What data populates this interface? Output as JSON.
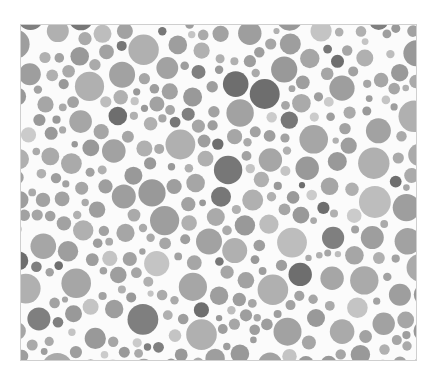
{
  "image": {
    "description": "Grayscale Ishihara-style color vision test plate of packed circles",
    "plate": {
      "x": 20,
      "y": 24,
      "width": 397,
      "height": 337
    },
    "background": "#fbfbfb",
    "palette": {
      "mid": [
        "#9e9e9e",
        "#a6a6a6",
        "#aaaaaa",
        "#999999",
        "#a2a2a2",
        "#b0b0b0"
      ],
      "dark": [
        "#6e6e6e",
        "#777777",
        "#7f7f7f"
      ],
      "light": [
        "#c4c4c4",
        "#cbcbcb",
        "#bdbdbd"
      ]
    },
    "generator": {
      "seed": 1337,
      "min_r": 3,
      "max_r": 16,
      "attempts": 9000,
      "gap": 1.6,
      "dark_ratio": 0.09,
      "light_ratio": 0.1
    }
  }
}
